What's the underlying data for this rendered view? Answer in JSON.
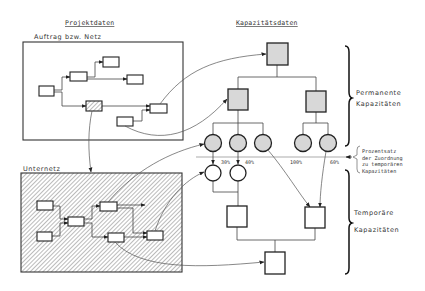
{
  "headings": {
    "project_data": "Projektdaten",
    "capacity_data": "Kapazitätsdaten"
  },
  "left": {
    "order_network_label": "Auftrag bzw. Netz",
    "subnetwork_label": "Unternetz"
  },
  "right": {
    "permanent_line1": "Permanente",
    "permanent_line2": "Kapazitäten",
    "temporary_line1": "Temporäre",
    "temporary_line2": "Kapazitäten",
    "percent_note": [
      "Prozentsatz",
      "der Zuordnung",
      "zu temporären",
      "Kapazitäten"
    ]
  },
  "percentages": {
    "p1": "30%",
    "p2": "40%",
    "p3": "100%",
    "p4": "60%"
  },
  "colors": {
    "permanent_fill": "#d8d8d8",
    "temporary_fill": "#ffffff",
    "stroke": "#222222"
  }
}
